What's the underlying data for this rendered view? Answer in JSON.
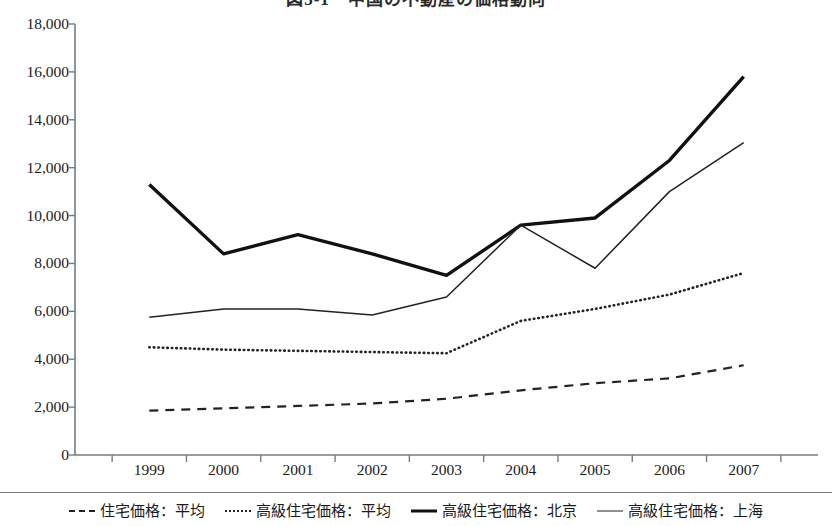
{
  "chart_data": {
    "type": "line",
    "title": "図3-1　中国の不動産の価格動向",
    "xlabel": "",
    "ylabel": "",
    "categories": [
      "1999",
      "2000",
      "2001",
      "2002",
      "2003",
      "2004",
      "2005",
      "2006",
      "2007"
    ],
    "ylim": [
      0,
      18000
    ],
    "ytick_step": 2000,
    "ytick_labels": [
      "18,000",
      "16,000",
      "14,000",
      "12,000",
      "10,000",
      "8,000",
      "6,000",
      "4,000",
      "2,000",
      "0"
    ],
    "ytick_values": [
      18000,
      16000,
      14000,
      12000,
      10000,
      8000,
      6000,
      4000,
      2000,
      0
    ],
    "grid": false,
    "legend_position": "bottom",
    "series": [
      {
        "name": "住宅価格：平均",
        "style": "dashed",
        "values": [
          1850,
          1950,
          2050,
          2150,
          2350,
          2700,
          3000,
          3200,
          3750
        ]
      },
      {
        "name": "高級住宅価格：平均",
        "style": "dotted",
        "values": [
          4500,
          4400,
          4350,
          4300,
          4250,
          5600,
          6100,
          6700,
          7600
        ]
      },
      {
        "name": "高級住宅価格：北京",
        "style": "thick-solid",
        "values": [
          11300,
          8400,
          9200,
          8400,
          7500,
          9600,
          9900,
          12300,
          15800
        ]
      },
      {
        "name": "高級住宅価格：上海",
        "style": "thin-solid",
        "values": [
          5750,
          6100,
          6100,
          5850,
          6600,
          9600,
          7800,
          11000,
          13050
        ]
      }
    ]
  },
  "colors": {
    "axis": "#7a7a7a",
    "line_dark": "#111111",
    "line_mid": "#222222",
    "text": "#1a1a1a",
    "background": "#ffffff"
  }
}
